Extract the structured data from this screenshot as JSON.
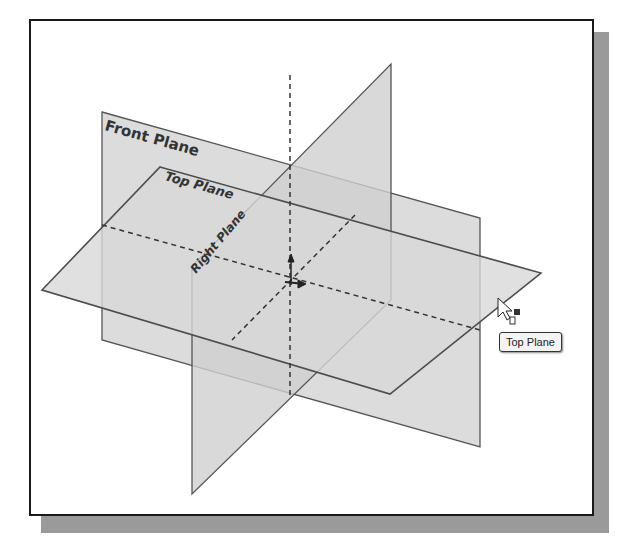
{
  "figure": {
    "planes": {
      "front": {
        "label": "Front Plane"
      },
      "top": {
        "label": "Top Plane"
      },
      "right": {
        "label": "Right Plane"
      }
    },
    "tooltip": {
      "label": "Top Plane"
    },
    "colors": {
      "plane_fill": "#d4d4d4",
      "plane_edge": "#555555",
      "frame_border": "#1a1a1a",
      "shadow": "#9a9a9a"
    }
  }
}
